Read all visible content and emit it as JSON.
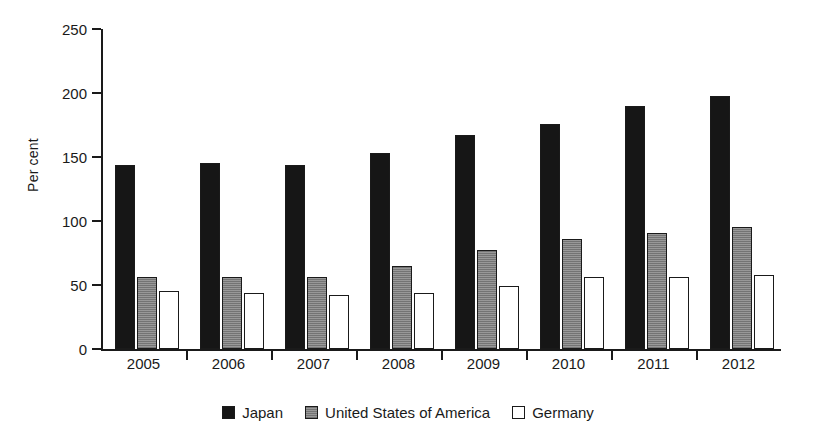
{
  "chart_data": {
    "type": "bar",
    "title": "",
    "xlabel": "",
    "ylabel": "Per cent",
    "ylim": [
      0,
      250
    ],
    "yticks": [
      0,
      50,
      100,
      150,
      200,
      250
    ],
    "grid": false,
    "legend_position": "bottom-center",
    "categories": [
      "2005",
      "2006",
      "2007",
      "2008",
      "2009",
      "2010",
      "2011",
      "2012"
    ],
    "series": [
      {
        "name": "Japan",
        "color": "#161616",
        "values": [
          144,
          145,
          144,
          153,
          167,
          176,
          190,
          198
        ]
      },
      {
        "name": "United States of America",
        "color": "#8d8d8d",
        "values": [
          56,
          56,
          56,
          65,
          77,
          86,
          91,
          95
        ]
      },
      {
        "name": "Germany",
        "color": "#ffffff",
        "values": [
          45,
          44,
          42,
          44,
          49,
          56,
          56,
          58
        ]
      }
    ]
  },
  "axis": {
    "y_label": "Per cent",
    "y_tick_labels": [
      "0",
      "50",
      "100",
      "150",
      "200",
      "250"
    ],
    "x_tick_labels": [
      "2005",
      "2006",
      "2007",
      "2008",
      "2009",
      "2010",
      "2011",
      "2012"
    ]
  },
  "legend": {
    "items": [
      {
        "label": "Japan",
        "swatch": "black-square-swatch"
      },
      {
        "label": "United States of America",
        "swatch": "gray-square-swatch"
      },
      {
        "label": "Germany",
        "swatch": "white-square-swatch"
      }
    ]
  }
}
